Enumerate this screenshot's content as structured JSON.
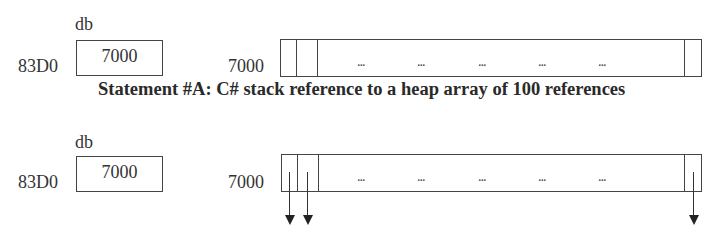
{
  "statement_a": {
    "variable_name": "db",
    "stack_address": "83D0",
    "stack_value": "7000",
    "heap_address": "7000",
    "ellipses": [
      "...",
      "...",
      "...",
      "...",
      "..."
    ],
    "caption": "Statement #A: C# stack reference to a heap array of 100 references"
  },
  "statement_b": {
    "variable_name": "db",
    "stack_address": "83D0",
    "stack_value": "7000",
    "heap_address": "7000",
    "ellipses": [
      "...",
      "...",
      "...",
      "...",
      "..."
    ],
    "arrows": [
      "element-0",
      "element-1",
      "element-99"
    ]
  }
}
